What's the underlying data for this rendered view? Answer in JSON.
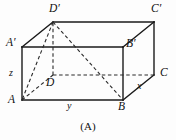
{
  "figure": {
    "caption": "(A)",
    "shape": "rectangular-box",
    "stroke_color": "#1a1a1a",
    "dashed_color": "#2a2a2a",
    "background_color": "#fdfdfd",
    "vertices": [
      {
        "id": "A",
        "label": "A",
        "x": 22,
        "y": 100,
        "hidden": false,
        "label_x": 13,
        "label_y": 100
      },
      {
        "id": "B",
        "label": "B",
        "x": 123,
        "y": 100,
        "hidden": false,
        "label_x": 120,
        "label_y": 110
      },
      {
        "id": "C",
        "label": "C",
        "x": 154,
        "y": 75,
        "hidden": false,
        "label_x": 160,
        "label_y": 74
      },
      {
        "id": "D",
        "label": "D",
        "x": 53,
        "y": 75,
        "hidden": true,
        "label_x": 47,
        "label_y": 86
      },
      {
        "id": "Ap",
        "label": "A′",
        "x": 22,
        "y": 47,
        "hidden": false,
        "label_x": 8,
        "label_y": 42
      },
      {
        "id": "Bp",
        "label": "B′",
        "x": 123,
        "y": 47,
        "hidden": false,
        "label_x": 126,
        "label_y": 45
      },
      {
        "id": "Cp",
        "label": "C′",
        "x": 154,
        "y": 22,
        "hidden": false,
        "label_x": 152,
        "label_y": 12
      },
      {
        "id": "Dp",
        "label": "D′",
        "x": 53,
        "y": 22,
        "hidden": false,
        "label_x": 50,
        "label_y": 11
      }
    ],
    "edge_labels": [
      {
        "id": "z",
        "label": "z",
        "x": 11,
        "y": 72,
        "edge": "A-A'"
      },
      {
        "id": "y",
        "label": "y",
        "x": 69,
        "y": 104,
        "edge": "A-B"
      },
      {
        "id": "x",
        "label": "x",
        "x": 138,
        "y": 86,
        "edge": "B-C"
      }
    ],
    "solid_edges": [
      {
        "from": "A",
        "to": "B"
      },
      {
        "from": "A",
        "to": "Ap"
      },
      {
        "from": "B",
        "to": "Bp"
      },
      {
        "from": "B",
        "to": "C"
      },
      {
        "from": "C",
        "to": "Cp"
      },
      {
        "from": "Ap",
        "to": "Bp"
      },
      {
        "from": "Ap",
        "to": "Dp"
      },
      {
        "from": "Bp",
        "to": "Cp"
      },
      {
        "from": "Dp",
        "to": "Cp"
      }
    ],
    "hidden_edges": [
      {
        "from": "A",
        "to": "D"
      },
      {
        "from": "D",
        "to": "C"
      },
      {
        "from": "D",
        "to": "Dp"
      }
    ],
    "construction_lines": [
      {
        "from": "Dp",
        "to": "A"
      },
      {
        "from": "Dp",
        "to": "B"
      }
    ]
  }
}
